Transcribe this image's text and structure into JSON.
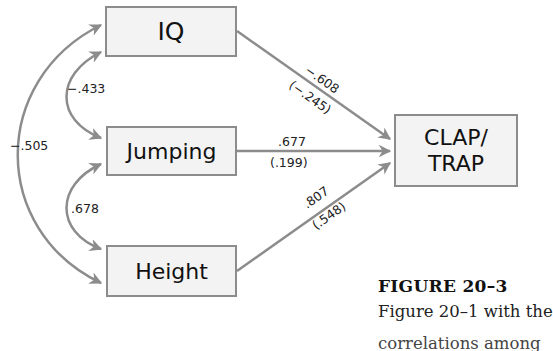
{
  "diagram": {
    "nodes": [
      {
        "id": "iq",
        "label": "IQ"
      },
      {
        "id": "jumping",
        "label": "Jumping"
      },
      {
        "id": "height",
        "label": "Height"
      },
      {
        "id": "clap_trap",
        "label_line1": "CLAP/",
        "label_line2": "TRAP"
      }
    ],
    "correlations": [
      {
        "from": "iq",
        "to": "jumping",
        "value": "−.433"
      },
      {
        "from": "iq",
        "to": "height",
        "value": "−.505"
      },
      {
        "from": "jumping",
        "to": "height",
        "value": ".678"
      }
    ],
    "paths": [
      {
        "from": "iq",
        "to": "clap_trap",
        "coefficient": "−.608",
        "standardized": "(−.245)"
      },
      {
        "from": "jumping",
        "to": "clap_trap",
        "coefficient": ".677",
        "standardized": "(.199)"
      },
      {
        "from": "height",
        "to": "clap_trap",
        "coefficient": ".807",
        "standardized": "(.548)"
      }
    ],
    "colors": {
      "line": "#8c8c8c",
      "box_fill": "#f3f3f3",
      "box_border": "#8c8c8c"
    }
  },
  "caption": {
    "title": "FIGURE 20–3",
    "body": "Figure 20–1 with the",
    "cut_line": "correlations among"
  }
}
